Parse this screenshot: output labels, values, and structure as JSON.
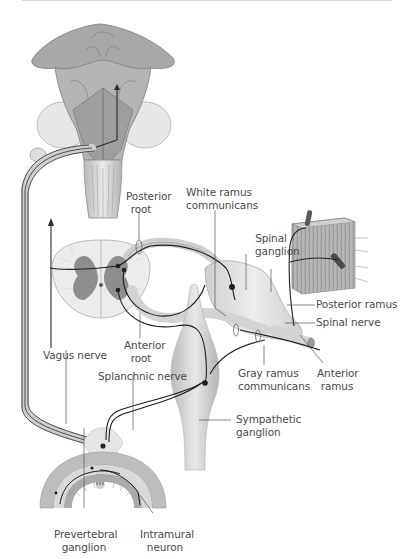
{
  "figure": {
    "type": "anatomical diagram"
  },
  "labels": {
    "posterior_root": "Posterior\nroot",
    "posterior_root_l1": "Posterior",
    "posterior_root_l2": "root",
    "white_ramus_l1": "White ramus",
    "white_ramus_l2": "communicans",
    "spinal_ganglion_l1": "Spinal",
    "spinal_ganglion_l2": "ganglion",
    "posterior_ramus": "Posterior ramus",
    "spinal_nerve": "Spinal nerve",
    "anterior_root_l1": "Anterior",
    "anterior_root_l2": "root",
    "vagus_nerve": "Vagus nerve",
    "splanchnic_nerve": "Splanchnic nerve",
    "gray_ramus_l1": "Gray ramus",
    "gray_ramus_l2": "communicans",
    "anterior_ramus_l1": "Anterior",
    "anterior_ramus_l2": "ramus",
    "sympathetic_ganglion_l1": "Sympathetic",
    "sympathetic_ganglion_l2": "ganglion",
    "prevertebral_ganglion_l1": "Prevertebral",
    "prevertebral_ganglion_l2": "ganglion",
    "intramural_neuron_l1": "Intramural",
    "intramural_neuron_l2": "neuron"
  },
  "colors": {
    "background": "#ffffff",
    "tissue_light": "#e4e4e4",
    "tissue_mid": "#c9c9c9",
    "tissue_dark": "#8f8f8f",
    "nerve_line": "#2a2a2a",
    "label_text": "#4a4a4a",
    "leader_line": "#555555"
  }
}
